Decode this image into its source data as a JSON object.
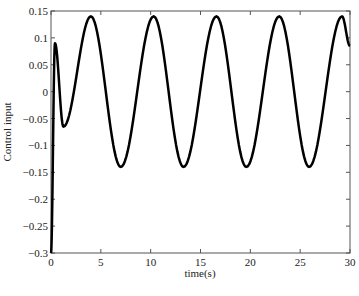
{
  "chart_data": {
    "type": "line",
    "title": "",
    "xlabel": "time(s)",
    "ylabel": "Control input",
    "xlim": [
      0,
      30
    ],
    "ylim": [
      -0.3,
      0.15
    ],
    "grid": false,
    "legend": null,
    "x_ticks": [
      0,
      5,
      10,
      15,
      20,
      25,
      30
    ],
    "x_tick_labels": [
      "0",
      "5",
      "10",
      "15",
      "20",
      "25",
      "30"
    ],
    "y_ticks": [
      0.15,
      0.1,
      0.05,
      0,
      -0.05,
      -0.1,
      -0.15,
      -0.2,
      -0.25,
      -0.3
    ],
    "y_tick_labels": [
      "0.15",
      "0.1",
      "0.05",
      "0",
      "-0.05",
      "-0.1",
      "-0.15",
      "-0.2",
      "-0.25",
      "-0.3"
    ],
    "series": [
      {
        "name": "Control input",
        "color": "#000000",
        "line_width": 2.5,
        "key_points": {
          "x": [
            0,
            0.4,
            1.25,
            4.0,
            7.0,
            10.3,
            13.3,
            16.6,
            19.6,
            22.9,
            25.9,
            29.2,
            30
          ],
          "y": [
            -0.3,
            0.09,
            -0.065,
            0.14,
            -0.14,
            0.14,
            -0.14,
            0.14,
            -0.14,
            0.14,
            -0.14,
            0.14,
            0.085
          ]
        },
        "description": "Initial transient from -0.3 rising to ~0.09, dip to ~-0.065, then steady sinusoid amplitude ~0.14 with period ~6.3s"
      }
    ]
  }
}
